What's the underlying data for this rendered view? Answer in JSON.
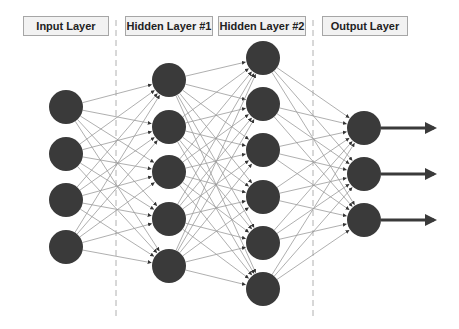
{
  "diagram": {
    "layers": [
      {
        "label": "Input Layer",
        "nodes": 4
      },
      {
        "label": "Hidden Layer #1",
        "nodes": 5
      },
      {
        "label": "Hidden Layer #2",
        "nodes": 6
      },
      {
        "label": "Output Layer",
        "nodes": 3
      }
    ],
    "colors": {
      "node": "#3a3a3a",
      "edge": "#9a9a9a",
      "output_arrow": "#3a3a3a",
      "divider": "#b0b0b0"
    }
  }
}
